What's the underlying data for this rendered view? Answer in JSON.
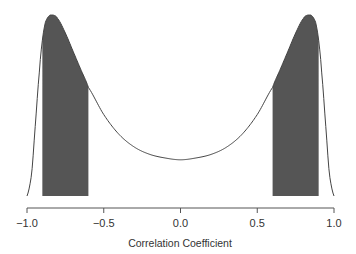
{
  "chart_data": {
    "type": "area",
    "title": "",
    "xlabel": "Correlation Coefficient",
    "ylabel": "",
    "xlim": [
      -1.0,
      1.0
    ],
    "x_ticks": [
      -1.0,
      -0.5,
      0.0,
      0.5,
      1.0
    ],
    "x_tick_labels": [
      "−1.0",
      "−0.5",
      "0.0",
      "0.5",
      "1.0"
    ],
    "grid": false,
    "legend": null,
    "x": [
      -1.0,
      -0.97,
      -0.95,
      -0.92,
      -0.9,
      -0.88,
      -0.85,
      -0.83,
      -0.8,
      -0.75,
      -0.7,
      -0.65,
      -0.6,
      -0.5,
      -0.4,
      -0.3,
      -0.2,
      -0.1,
      0.0,
      0.1,
      0.2,
      0.3,
      0.4,
      0.5,
      0.6,
      0.65,
      0.7,
      0.75,
      0.8,
      0.83,
      0.85,
      0.88,
      0.9,
      0.92,
      0.95,
      0.97,
      1.0
    ],
    "density": [
      0.0,
      0.12,
      0.35,
      0.68,
      0.86,
      0.96,
      1.0,
      1.0,
      0.98,
      0.9,
      0.8,
      0.7,
      0.6,
      0.45,
      0.34,
      0.27,
      0.23,
      0.21,
      0.2,
      0.21,
      0.23,
      0.27,
      0.34,
      0.45,
      0.6,
      0.7,
      0.8,
      0.9,
      0.98,
      1.0,
      1.0,
      0.96,
      0.86,
      0.68,
      0.35,
      0.12,
      0.0
    ],
    "shaded_regions": [
      {
        "from": -0.9,
        "to": -0.6,
        "color": "#555555"
      },
      {
        "from": 0.6,
        "to": 0.9,
        "color": "#555555"
      }
    ],
    "curve_color": "#444444"
  }
}
